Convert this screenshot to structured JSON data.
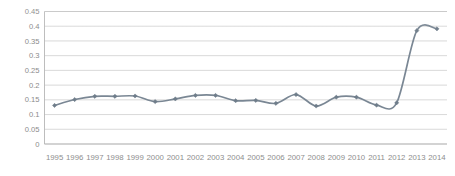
{
  "chart_data": {
    "type": "line",
    "title": "",
    "subtitle": "",
    "xlabel": "",
    "ylabel": "",
    "categories": [
      "1995",
      "1996",
      "1997",
      "1998",
      "1999",
      "2000",
      "2001",
      "2002",
      "2003",
      "2004",
      "2005",
      "2006",
      "2007",
      "2008",
      "2009",
      "2010",
      "2011",
      "2012",
      "2013",
      "2014"
    ],
    "values": [
      0.131,
      0.151,
      0.162,
      0.162,
      0.163,
      0.144,
      0.153,
      0.165,
      0.165,
      0.147,
      0.148,
      0.138,
      0.168,
      0.129,
      0.159,
      0.159,
      0.132,
      0.14,
      0.385,
      0.391
    ],
    "series": [
      {
        "name": "",
        "values": [
          0.131,
          0.151,
          0.162,
          0.162,
          0.163,
          0.144,
          0.153,
          0.165,
          0.165,
          0.147,
          0.148,
          0.138,
          0.168,
          0.129,
          0.159,
          0.159,
          0.132,
          0.14,
          0.385,
          0.391
        ]
      }
    ],
    "ylim": [
      0,
      0.45
    ],
    "ytick_values": [
      0,
      0.05,
      0.1,
      0.15,
      0.2,
      0.25,
      0.3,
      0.35,
      0.4,
      0.45
    ],
    "ytick_labels": [
      "0",
      "0.05",
      "0.1",
      "0.15",
      "0.2",
      "0.25",
      "0.3",
      "0.35",
      "0.4",
      "0.45"
    ],
    "grid": true,
    "grid_axis": "y",
    "legend": false,
    "legend_position": "none",
    "markers": "diamond",
    "line_color": "#7a8794",
    "marker_color": "#6f7d8a",
    "grid_color": "#c9c9c9",
    "axis_color": "#b5b5b5",
    "tick_label_color": "#8a8a8a",
    "background_color": "#ffffff",
    "annotations": []
  }
}
